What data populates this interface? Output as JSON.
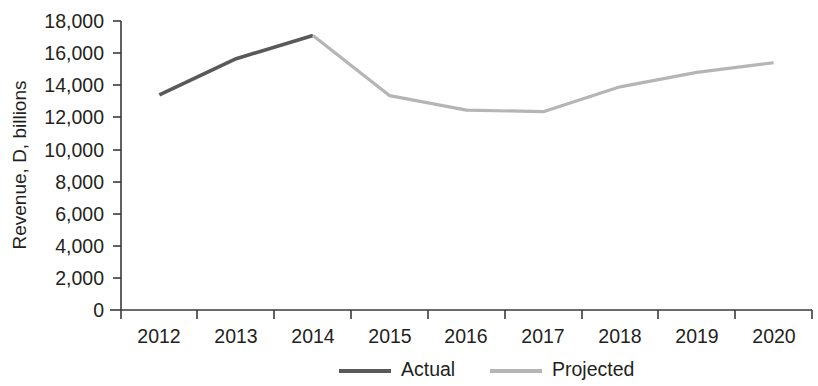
{
  "chart_data": {
    "type": "line",
    "title": "",
    "subtitle": "",
    "xlabel": "",
    "ylabel": "Revenue, D, billions",
    "categories": [
      "2012",
      "2013",
      "2014",
      "2015",
      "2016",
      "2017",
      "2018",
      "2019",
      "2020"
    ],
    "ylim": [
      0,
      18000
    ],
    "ytick_values": [
      0,
      2000,
      4000,
      6000,
      8000,
      10000,
      12000,
      14000,
      16000,
      18000
    ],
    "ytick_labels": [
      "0",
      "2,000",
      "4,000",
      "6,000",
      "8,000",
      "10,000",
      "12,000",
      "14,000",
      "16,000",
      "18,000"
    ],
    "xtick_labels": [
      "2012",
      "2013",
      "2014",
      "2015",
      "2016",
      "2017",
      "2018",
      "2019",
      "2020"
    ],
    "grid": false,
    "legend_position": "bottom-center",
    "series": [
      {
        "name": "Actual",
        "color": "#595959",
        "linewidth": 3.6,
        "x": [
          "2012",
          "2013",
          "2014"
        ],
        "values": [
          13400,
          15650,
          17100
        ]
      },
      {
        "name": "Projected",
        "color": "#b5b5b5",
        "linewidth": 3.2,
        "x": [
          "2014",
          "2015",
          "2016",
          "2017",
          "2018",
          "2019",
          "2020"
        ],
        "values": [
          17100,
          13350,
          12450,
          12350,
          13900,
          14800,
          15400
        ]
      }
    ],
    "legend": [
      {
        "label": "Actual",
        "color": "#595959"
      },
      {
        "label": "Projected",
        "color": "#b5b5b5"
      }
    ],
    "axis_color": "#3a3a3a",
    "text_color": "#231f20",
    "background": "#ffffff"
  }
}
